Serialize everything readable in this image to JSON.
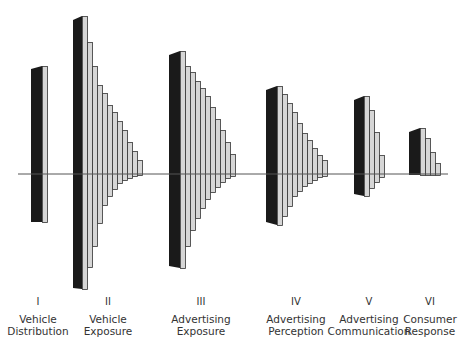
{
  "diagram": {
    "title": "",
    "baseline": {
      "x1": 18,
      "x2": 448,
      "y": 174,
      "color": "#555555"
    },
    "colors": {
      "dark": "#1a1a1a",
      "light": "#d6d6d6",
      "stroke": "#333333"
    },
    "stages": [
      {
        "numeral": "I",
        "line1": "Vehicle",
        "line2": "Distribution",
        "label_x": 38,
        "dark": {
          "x": 31,
          "w": 11,
          "top": 69,
          "bottom": 222
        },
        "bar_w": 5,
        "bars": [
          {
            "top": 66,
            "bottom": 222
          }
        ]
      },
      {
        "numeral": "II",
        "line1": "Vehicle",
        "line2": "Exposure",
        "label_x": 108,
        "dark": {
          "x": 73,
          "w": 9,
          "top": 20,
          "bottom": 288
        },
        "bar_w": 5,
        "bars": [
          {
            "top": 16,
            "bottom": 289
          },
          {
            "top": 42,
            "bottom": 267
          },
          {
            "top": 66,
            "bottom": 246
          },
          {
            "top": 85,
            "bottom": 223
          },
          {
            "top": 93,
            "bottom": 205
          },
          {
            "top": 105,
            "bottom": 196
          },
          {
            "top": 112,
            "bottom": 189
          },
          {
            "top": 121,
            "bottom": 183
          },
          {
            "top": 130,
            "bottom": 180
          },
          {
            "top": 142,
            "bottom": 178
          },
          {
            "top": 151,
            "bottom": 176
          },
          {
            "top": 160,
            "bottom": 175
          }
        ]
      },
      {
        "numeral": "III",
        "line1": "Advertising",
        "line2": "Exposure",
        "label_x": 201,
        "dark": {
          "x": 169,
          "w": 11,
          "top": 55,
          "bottom": 266
        },
        "bar_w": 5,
        "bars": [
          {
            "top": 51,
            "bottom": 268
          },
          {
            "top": 66,
            "bottom": 246
          },
          {
            "top": 72,
            "bottom": 230
          },
          {
            "top": 81,
            "bottom": 218
          },
          {
            "top": 88,
            "bottom": 208
          },
          {
            "top": 96,
            "bottom": 199
          },
          {
            "top": 107,
            "bottom": 192
          },
          {
            "top": 119,
            "bottom": 187
          },
          {
            "top": 130,
            "bottom": 182
          },
          {
            "top": 142,
            "bottom": 178
          },
          {
            "top": 154,
            "bottom": 176
          }
        ]
      },
      {
        "numeral": "IV",
        "line1": "Advertising",
        "line2": "Perception",
        "label_x": 296,
        "dark": {
          "x": 266,
          "w": 11,
          "top": 90,
          "bottom": 222
        },
        "bar_w": 5,
        "bars": [
          {
            "top": 86,
            "bottom": 225
          },
          {
            "top": 94,
            "bottom": 216
          },
          {
            "top": 103,
            "bottom": 206
          },
          {
            "top": 112,
            "bottom": 196
          },
          {
            "top": 123,
            "bottom": 191
          },
          {
            "top": 133,
            "bottom": 186
          },
          {
            "top": 140,
            "bottom": 183
          },
          {
            "top": 148,
            "bottom": 180
          },
          {
            "top": 155,
            "bottom": 177
          },
          {
            "top": 160,
            "bottom": 176
          }
        ]
      },
      {
        "numeral": "V",
        "line1": "Advertising",
        "line2": "Communication",
        "label_x": 369,
        "dark": {
          "x": 354,
          "w": 10,
          "top": 100,
          "bottom": 194
        },
        "bar_w": 5,
        "bars": [
          {
            "top": 96,
            "bottom": 196
          },
          {
            "top": 110,
            "bottom": 188
          },
          {
            "top": 132,
            "bottom": 182
          },
          {
            "top": 155,
            "bottom": 177
          }
        ]
      },
      {
        "numeral": "VI",
        "line1": "Consumer",
        "line2": "Response",
        "label_x": 430,
        "dark": {
          "x": 409,
          "w": 11,
          "top": 132,
          "bottom": 175
        },
        "bar_w": 5,
        "bars": [
          {
            "top": 128,
            "bottom": 175
          },
          {
            "top": 138,
            "bottom": 175
          },
          {
            "top": 152,
            "bottom": 175
          },
          {
            "top": 163,
            "bottom": 175
          }
        ]
      }
    ]
  }
}
